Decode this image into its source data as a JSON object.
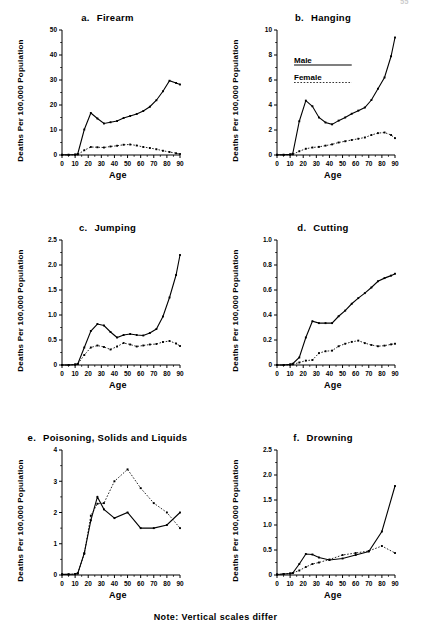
{
  "page": {
    "page_number": "55",
    "footnote": "Note: Vertical scales differ",
    "axis_label_y": "Deaths Per 100,000 Population",
    "axis_label_x": "Age"
  },
  "legend": {
    "male_label": "Male",
    "female_label": "Female",
    "male_style": "solid",
    "female_style": "dotted",
    "panel": "b"
  },
  "chart_data": [
    {
      "type": "line",
      "panel_letter": "a.",
      "title": "Firearm",
      "xlabel": "Age",
      "ylabel": "Deaths Per 100,000 Population",
      "xlim": [
        0,
        90
      ],
      "ylim": [
        0,
        50
      ],
      "xticks": [
        0,
        10,
        20,
        30,
        40,
        50,
        60,
        70,
        80,
        90
      ],
      "yticks": [
        0,
        10,
        20,
        30,
        40,
        50
      ],
      "ytick_labels": [
        "0",
        "10",
        "20",
        "30",
        "40",
        "50"
      ],
      "minor_xtick_step": 5,
      "grid": false,
      "legend_position": "none",
      "x": [
        0,
        5,
        10,
        12,
        17,
        22,
        27,
        32,
        37,
        42,
        47,
        52,
        57,
        62,
        67,
        72,
        77,
        82,
        87,
        90
      ],
      "series": [
        {
          "name": "Male",
          "style": "solid",
          "values": [
            0.1,
            0.1,
            0.2,
            0.4,
            10.2,
            16.8,
            14.6,
            12.6,
            13.1,
            13.6,
            14.8,
            15.6,
            16.4,
            17.6,
            19.3,
            21.9,
            25.5,
            29.7,
            28.8,
            28.2
          ]
        },
        {
          "name": "Female",
          "style": "dotted",
          "values": [
            0.05,
            0.05,
            0.1,
            0.2,
            1.9,
            3.2,
            3.1,
            3.0,
            3.4,
            3.7,
            4.1,
            4.2,
            3.8,
            3.2,
            2.8,
            2.3,
            1.7,
            1.2,
            0.7,
            0.4
          ]
        }
      ]
    },
    {
      "type": "line",
      "panel_letter": "b.",
      "title": "Hanging",
      "xlabel": "Age",
      "ylabel": "Deaths Per 100,000 Population",
      "xlim": [
        0,
        90
      ],
      "ylim": [
        0,
        10
      ],
      "xticks": [
        0,
        10,
        20,
        30,
        40,
        50,
        60,
        70,
        80,
        90
      ],
      "yticks": [
        0,
        2,
        4,
        6,
        8,
        10
      ],
      "ytick_labels": [
        "0",
        "2",
        "4",
        "6",
        "8",
        "10"
      ],
      "minor_xtick_step": 5,
      "grid": false,
      "legend_position": "upper-left",
      "x": [
        0,
        5,
        10,
        12,
        17,
        22,
        27,
        32,
        37,
        42,
        47,
        52,
        57,
        62,
        67,
        72,
        77,
        82,
        87,
        90
      ],
      "series": [
        {
          "name": "Male",
          "style": "solid",
          "values": [
            0.02,
            0.02,
            0.05,
            0.1,
            2.7,
            4.35,
            3.9,
            3.0,
            2.6,
            2.45,
            2.75,
            3.0,
            3.3,
            3.55,
            3.8,
            4.4,
            5.3,
            6.2,
            7.9,
            9.4
          ]
        },
        {
          "name": "Female",
          "style": "dotted",
          "values": [
            0.01,
            0.01,
            0.03,
            0.05,
            0.3,
            0.5,
            0.6,
            0.65,
            0.75,
            0.85,
            1.0,
            1.1,
            1.2,
            1.3,
            1.4,
            1.6,
            1.75,
            1.8,
            1.6,
            1.35
          ]
        }
      ]
    },
    {
      "type": "line",
      "panel_letter": "c.",
      "title": "Jumping",
      "xlabel": "Age",
      "ylabel": "Deaths Per 100,000 Population",
      "xlim": [
        0,
        90
      ],
      "ylim": [
        0,
        2.5
      ],
      "xticks": [
        0,
        10,
        20,
        30,
        40,
        50,
        60,
        70,
        80,
        90
      ],
      "yticks": [
        0,
        0.5,
        1.0,
        1.5,
        2.0,
        2.5
      ],
      "ytick_labels": [
        "0",
        "0.5",
        "1.0",
        "1.5",
        "2.0",
        "2.5"
      ],
      "minor_xtick_step": 5,
      "grid": false,
      "legend_position": "none",
      "x": [
        0,
        5,
        10,
        12,
        17,
        22,
        27,
        32,
        37,
        42,
        47,
        52,
        57,
        62,
        67,
        72,
        77,
        82,
        87,
        90
      ],
      "series": [
        {
          "name": "Male",
          "style": "solid",
          "values": [
            0.0,
            0.0,
            0.01,
            0.02,
            0.35,
            0.68,
            0.82,
            0.79,
            0.66,
            0.55,
            0.6,
            0.62,
            0.6,
            0.59,
            0.64,
            0.72,
            0.97,
            1.35,
            1.8,
            2.2
          ]
        },
        {
          "name": "Female",
          "style": "dotted",
          "values": [
            0.0,
            0.0,
            0.01,
            0.02,
            0.2,
            0.35,
            0.39,
            0.36,
            0.31,
            0.37,
            0.44,
            0.41,
            0.37,
            0.39,
            0.41,
            0.42,
            0.46,
            0.48,
            0.43,
            0.38
          ]
        }
      ]
    },
    {
      "type": "line",
      "panel_letter": "d.",
      "title": "Cutting",
      "xlabel": "Age",
      "ylabel": "Deaths Per 100,000 Population",
      "xlim": [
        0,
        90
      ],
      "ylim": [
        0,
        1.0
      ],
      "xticks": [
        0,
        10,
        20,
        30,
        40,
        50,
        60,
        70,
        80,
        90
      ],
      "yticks": [
        0,
        0.2,
        0.4,
        0.6,
        0.8,
        1.0
      ],
      "ytick_labels": [
        "0",
        "0.2",
        "0.4",
        "0.6",
        "0.8",
        "1.0"
      ],
      "minor_xtick_step": 5,
      "grid": false,
      "legend_position": "none",
      "x": [
        0,
        5,
        10,
        12,
        17,
        22,
        27,
        32,
        37,
        42,
        47,
        52,
        57,
        62,
        67,
        72,
        77,
        82,
        87,
        90
      ],
      "series": [
        {
          "name": "Male",
          "style": "solid",
          "values": [
            0.0,
            0.0,
            0.005,
            0.01,
            0.06,
            0.22,
            0.35,
            0.335,
            0.335,
            0.335,
            0.39,
            0.435,
            0.49,
            0.535,
            0.575,
            0.62,
            0.67,
            0.695,
            0.715,
            0.73
          ]
        },
        {
          "name": "Female",
          "style": "dotted",
          "values": [
            0.0,
            0.0,
            0.002,
            0.005,
            0.02,
            0.035,
            0.04,
            0.095,
            0.11,
            0.115,
            0.15,
            0.17,
            0.185,
            0.195,
            0.175,
            0.16,
            0.15,
            0.155,
            0.165,
            0.17
          ]
        }
      ]
    },
    {
      "type": "line",
      "panel_letter": "e.",
      "title": "Poisoning, Solids and Liquids",
      "xlabel": "Age",
      "ylabel": "Deaths Per 100,000 Population",
      "xlim": [
        0,
        90
      ],
      "ylim": [
        0,
        4
      ],
      "xticks": [
        0,
        10,
        20,
        30,
        40,
        50,
        60,
        70,
        80,
        90
      ],
      "yticks": [
        0,
        1,
        2,
        3,
        4
      ],
      "ytick_labels": [
        "0",
        "1",
        "2",
        "3",
        "4"
      ],
      "minor_xtick_step": 5,
      "grid": false,
      "legend_position": "none",
      "x": [
        0,
        5,
        10,
        12,
        17,
        22,
        27,
        32,
        40,
        50,
        60,
        70,
        80,
        90
      ],
      "series": [
        {
          "name": "Male",
          "style": "solid",
          "values": [
            0.02,
            0.02,
            0.03,
            0.05,
            0.7,
            1.75,
            2.5,
            2.1,
            1.82,
            2.0,
            1.5,
            1.5,
            1.6,
            2.0
          ]
        },
        {
          "name": "Female",
          "style": "dotted",
          "values": [
            0.02,
            0.02,
            0.03,
            0.05,
            0.68,
            1.9,
            2.28,
            2.3,
            3.0,
            3.38,
            2.78,
            2.3,
            2.0,
            1.5
          ]
        }
      ]
    },
    {
      "type": "line",
      "panel_letter": "f.",
      "title": "Drowning",
      "xlabel": "Age",
      "ylabel": "Deaths Per 100,000 Population",
      "xlim": [
        0,
        90
      ],
      "ylim": [
        0,
        2.5
      ],
      "xticks": [
        0,
        10,
        20,
        30,
        40,
        50,
        60,
        70,
        80,
        90
      ],
      "yticks": [
        0,
        0.5,
        1.0,
        1.5,
        2.0,
        2.5
      ],
      "ytick_labels": [
        "0",
        "0.5",
        "1.0",
        "1.5",
        "2.0",
        "2.5"
      ],
      "minor_xtick_step": 5,
      "grid": false,
      "legend_position": "none",
      "x": [
        0,
        5,
        10,
        12,
        17,
        22,
        27,
        32,
        40,
        50,
        60,
        70,
        80,
        90
      ],
      "series": [
        {
          "name": "Male",
          "style": "solid",
          "values": [
            0.01,
            0.02,
            0.03,
            0.04,
            0.22,
            0.42,
            0.41,
            0.35,
            0.3,
            0.33,
            0.4,
            0.47,
            0.87,
            1.78
          ]
        },
        {
          "name": "Female",
          "style": "dotted",
          "values": [
            0.01,
            0.02,
            0.03,
            0.04,
            0.09,
            0.16,
            0.22,
            0.25,
            0.31,
            0.4,
            0.44,
            0.48,
            0.58,
            0.44
          ]
        }
      ]
    }
  ]
}
